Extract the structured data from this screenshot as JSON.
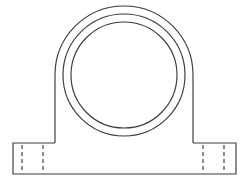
{
  "drawing": {
    "title": "Pillow Block Bearing Housing - Front Elevation",
    "view": "front elevation",
    "background_color": "#ffffff",
    "line_color": "#3a3a3a",
    "hidden_line_color": "#2e2e2e",
    "canvas": {
      "width": 249,
      "height": 188
    },
    "geometry": {
      "bore_center": {
        "x": 124,
        "y": 75
      },
      "outer_housing_arc": {
        "name": "outer-housing-profile",
        "radius": 69,
        "top_y": 6,
        "left_wall_x": 55,
        "right_wall_x": 193,
        "wall_bottom_y": 143
      },
      "middle_circle": {
        "name": "housing-bore-outer-circle",
        "radius": 61,
        "top_y": 14,
        "bottom_y": 136
      },
      "inner_circle": {
        "name": "bearing-bore-circle",
        "radius": 53,
        "top_y": 22,
        "bottom_y": 128
      },
      "base": {
        "name": "mounting-base",
        "left_x": 13,
        "right_x": 236,
        "top_y": 143,
        "bottom_y": 174,
        "left_shoulder_x": 55,
        "right_shoulder_x": 193
      },
      "hidden_lines": {
        "name": "bolt-slot-hidden-edges",
        "top_y": 145,
        "bottom_y": 173,
        "positions_x": [
          22,
          43,
          203,
          224
        ]
      }
    },
    "features": [
      {
        "name": "outer-housing-profile",
        "label": "Outer housing profile"
      },
      {
        "name": "housing-bore-outer-circle",
        "label": "Housing wall circle"
      },
      {
        "name": "bearing-bore-circle",
        "label": "Bearing bore circle"
      },
      {
        "name": "mounting-base",
        "label": "Mounting base flange"
      },
      {
        "name": "bolt-slot-hidden-edges",
        "label": "Bolt slot hidden edges"
      }
    ]
  }
}
